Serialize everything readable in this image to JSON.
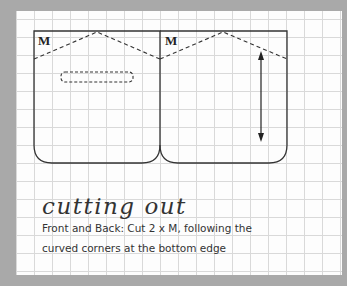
{
  "diagram": {
    "pieces": [
      {
        "label": "M"
      },
      {
        "label": "M"
      }
    ],
    "colors": {
      "background": "#a9a9a9",
      "paper": "#fdfdfd",
      "grid": "#d9d9d9",
      "lines": "#333333"
    }
  },
  "instructions": {
    "heading": "cutting out",
    "line1": "Front and Back: Cut 2 x M, following the",
    "line2": "curved corners at the bottom edge"
  }
}
